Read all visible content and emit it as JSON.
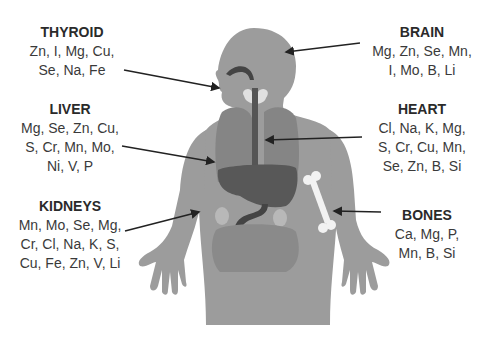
{
  "diagram": {
    "colors": {
      "body": "#9c9c9c",
      "organ": "#7e7e7e",
      "organ_dark": "#555555",
      "text": "#333333",
      "arrow": "#222222",
      "bone": "#f2f2f2"
    },
    "labels": {
      "thyroid": {
        "title": "THYROID",
        "lines": [
          "Zn, I, Mg, Cu,",
          "Se, Na, Fe"
        ]
      },
      "liver": {
        "title": "LIVER",
        "lines": [
          "Mg, Se, Zn, Cu,",
          "S, Cr, Mn, Mo,",
          "Ni, V, P"
        ]
      },
      "kidneys": {
        "title": "KIDNEYS",
        "lines": [
          "Mn, Mo, Se, Mg,",
          "Cr, Cl, Na, K, S,",
          "Cu, Fe, Zn, V, Li"
        ]
      },
      "brain": {
        "title": "BRAIN",
        "lines": [
          "Mg, Zn, Se, Mn,",
          "I, Mo, B, Li"
        ]
      },
      "heart": {
        "title": "HEART",
        "lines": [
          "Cl, Na, K, Mg,",
          "S, Cr, Cu, Mn,",
          "Se, Zn, B, Si"
        ]
      },
      "bones": {
        "title": "BONES",
        "lines": [
          "Ca, Mg, P,",
          "Mn, B, Si"
        ]
      }
    }
  }
}
